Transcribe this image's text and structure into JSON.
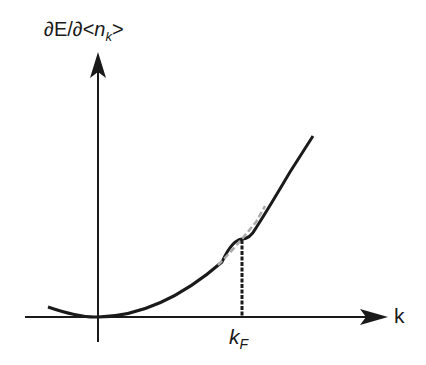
{
  "diagram": {
    "y_axis_label": {
      "prefix": "∂E/∂<",
      "var": "n",
      "sub": "k",
      "suffix": ">"
    },
    "x_axis_label": "k",
    "marker_label": {
      "main": "k",
      "sub": "F"
    },
    "colors": {
      "line": "#1a1a1a",
      "dashed_overlay": "#aaaaaa",
      "background": "#ffffff"
    }
  }
}
